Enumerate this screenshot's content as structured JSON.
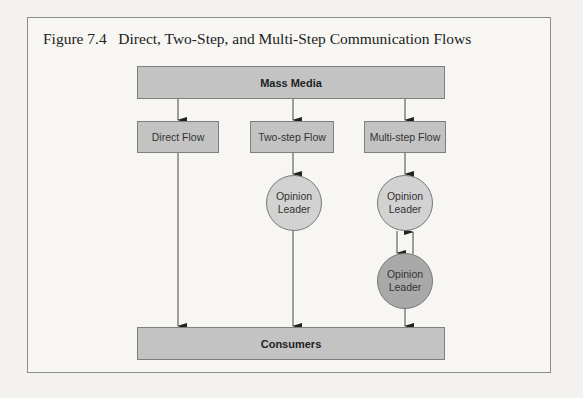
{
  "figure": {
    "title": "Figure 7.4   Direct, Two-Step, and Multi-Step Communication Flows"
  },
  "diagram": {
    "source": "Mass Media",
    "target": "Consumers",
    "flows": [
      {
        "label": "Direct Flow",
        "intermediaries": []
      },
      {
        "label": "Two-step Flow",
        "intermediaries": [
          "Opinion Leader"
        ]
      },
      {
        "label": "Multi-step Flow",
        "intermediaries": [
          "Opinion Leader",
          "Opinion Leader"
        ],
        "bidirectional_between_leaders": true
      }
    ],
    "nodes": {
      "mass_media": "Mass Media",
      "direct_flow": "Direct Flow",
      "two_step_flow": "Two-step Flow",
      "multi_step_flow": "Multi-step Flow",
      "leader_two_step_line1": "Opinion",
      "leader_two_step_line2": "Leader",
      "leader_multi_a_line1": "Opinion",
      "leader_multi_a_line2": "Leader",
      "leader_multi_b_line1": "Opinion",
      "leader_multi_b_line2": "Leader",
      "consumers": "Consumers"
    },
    "colors": {
      "box_fill": "#c3c3c3",
      "leader_fill": "#d2d2d2",
      "leader_dark_fill": "#a9a9a9",
      "line": "#333333"
    }
  }
}
